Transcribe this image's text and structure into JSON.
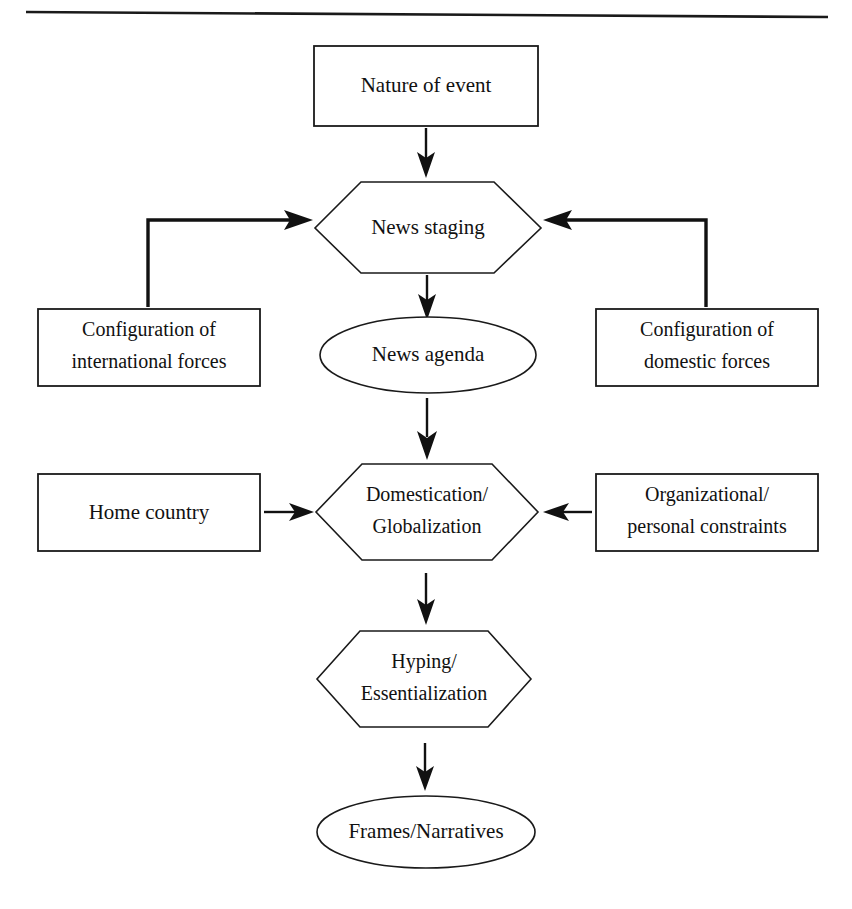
{
  "figure": {
    "type": "flowchart",
    "orientation": "top-to-bottom",
    "top_rule": true
  },
  "nodes": {
    "nature_of_event": {
      "label": "Nature of event",
      "shape": "rectangle"
    },
    "news_staging": {
      "label": "News staging",
      "shape": "hexagon"
    },
    "config_international": {
      "line1": "Configuration of",
      "line2": "international forces",
      "shape": "rectangle"
    },
    "config_domestic": {
      "line1": "Configuration of",
      "line2": "domestic forces",
      "shape": "rectangle"
    },
    "news_agenda": {
      "label": "News agenda",
      "shape": "ellipse"
    },
    "home_country": {
      "label": "Home country",
      "shape": "rectangle"
    },
    "domestication": {
      "line1": "Domestication/",
      "line2": "Globalization",
      "shape": "hexagon"
    },
    "organizational": {
      "line1": "Organizational/",
      "line2": "personal constraints",
      "shape": "rectangle"
    },
    "hyping": {
      "line1": "Hyping/",
      "line2": "Essentialization",
      "shape": "hexagon"
    },
    "frames": {
      "label": "Frames/Narratives",
      "shape": "ellipse"
    }
  },
  "edges": [
    {
      "from": "nature_of_event",
      "to": "news_staging",
      "style": "vertical-arrow"
    },
    {
      "from": "config_international",
      "to": "news_staging",
      "style": "elbow-arrow-right"
    },
    {
      "from": "config_domestic",
      "to": "news_staging",
      "style": "elbow-arrow-left"
    },
    {
      "from": "news_staging",
      "to": "news_agenda",
      "style": "vertical-arrow"
    },
    {
      "from": "news_agenda",
      "to": "domestication",
      "style": "vertical-arrow"
    },
    {
      "from": "home_country",
      "to": "domestication",
      "style": "horizontal-arrow-right"
    },
    {
      "from": "organizational",
      "to": "domestication",
      "style": "horizontal-arrow-left"
    },
    {
      "from": "domestication",
      "to": "hyping",
      "style": "vertical-arrow"
    },
    {
      "from": "hyping",
      "to": "frames",
      "style": "vertical-arrow"
    }
  ],
  "colors": {
    "stroke": "#111111",
    "fill": "#ffffff",
    "background": "#ffffff"
  }
}
